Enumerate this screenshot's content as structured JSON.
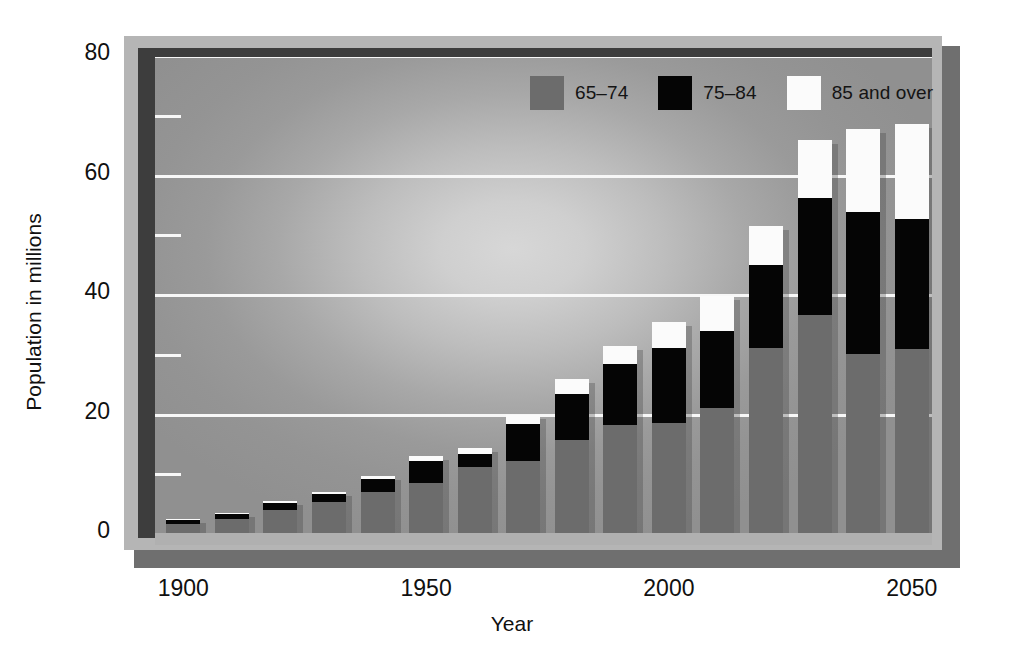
{
  "chart_data": {
    "type": "bar",
    "subtype": "stacked",
    "title": "",
    "xlabel": "Year",
    "ylabel": "Population in millions",
    "ylim": [
      0,
      80
    ],
    "yticks": [
      0,
      20,
      40,
      60,
      80
    ],
    "yticks_minor": [
      10,
      30,
      50,
      70
    ],
    "xticks": [
      1900,
      1950,
      2000,
      2050
    ],
    "grid": "horizontal",
    "legend_position": "top-right",
    "categories": [
      "1900",
      "1910",
      "1920",
      "1930",
      "1940",
      "1950",
      "1960",
      "1970",
      "1980",
      "1990",
      "2000",
      "2010",
      "2020",
      "2030",
      "2040",
      "2050"
    ],
    "series": [
      {
        "name": "65–74",
        "color": "#6c6c6c",
        "values": [
          1.5,
          2.4,
          3.8,
          5.2,
          6.9,
          8.4,
          11.0,
          12.0,
          15.6,
          18.0,
          18.4,
          21.0,
          31.0,
          36.5,
          30.0,
          30.8
        ]
      },
      {
        "name": "75–84",
        "color": "#050505",
        "values": [
          0.7,
          0.8,
          1.2,
          1.4,
          2.1,
          3.7,
          2.3,
          6.2,
          7.7,
          10.3,
          12.5,
          12.8,
          13.8,
          19.5,
          23.8,
          21.8
        ]
      },
      {
        "name": "85 and over",
        "color": "#fbfbfb",
        "values": [
          0.1,
          0.2,
          0.3,
          0.3,
          0.5,
          0.8,
          0.9,
          1.5,
          2.4,
          3.0,
          4.4,
          5.8,
          6.6,
          9.8,
          13.8,
          15.9
        ]
      }
    ],
    "totals": [
      2.3,
      3.4,
      5.3,
      6.9,
      9.5,
      12.9,
      14.2,
      19.7,
      25.7,
      31.3,
      35.3,
      39.6,
      51.4,
      65.8,
      67.6,
      68.5
    ]
  },
  "axes": {
    "y_title": "Population in millions",
    "x_title": "Year",
    "y_tick_labels": [
      "0",
      "20",
      "40",
      "60",
      "80"
    ],
    "x_tick_labels": [
      "1900",
      "1950",
      "2000",
      "2050"
    ]
  },
  "legend": {
    "items": [
      {
        "label": "65–74",
        "color": "#6c6c6c"
      },
      {
        "label": "75–84",
        "color": "#050505"
      },
      {
        "label": "85 and over",
        "color": "#fbfbfb"
      }
    ]
  },
  "colors": {
    "series_65_74": "#6c6c6c",
    "series_75_84": "#050505",
    "series_85_over": "#fbfbfb",
    "gridline": "#f7f7f7",
    "frame": "#3d3d3d",
    "bevel": "#b5b5b5",
    "shadow": "#6f6f6f",
    "text": "#101010"
  }
}
